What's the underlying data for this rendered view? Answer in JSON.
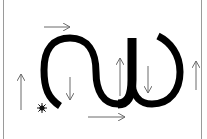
{
  "diagram": {
    "colors": {
      "background": "#ffffff",
      "curve": "#000000",
      "arrows": "#6b6b6b",
      "frame": "#9a9a9a",
      "star": "#111111"
    },
    "arrows": [
      {
        "id": "top-right-arrow",
        "direction": "right",
        "from": [
          44,
          27
        ],
        "to": [
          70,
          27
        ]
      },
      {
        "id": "left-up-arrow",
        "direction": "up",
        "from": [
          21,
          110
        ],
        "to": [
          21,
          74
        ]
      },
      {
        "id": "inner-down-arrow-left",
        "direction": "down",
        "from": [
          70,
          77
        ],
        "to": [
          70,
          100
        ]
      },
      {
        "id": "bottom-right-arrow",
        "direction": "right",
        "from": [
          88,
          117
        ],
        "to": [
          125,
          117
        ]
      },
      {
        "id": "inner-up-arrow",
        "direction": "up",
        "from": [
          120,
          96
        ],
        "to": [
          120,
          58
        ]
      },
      {
        "id": "inner-down-arrow-right",
        "direction": "down",
        "from": [
          148,
          66
        ],
        "to": [
          148,
          93
        ]
      },
      {
        "id": "right-up-arrow",
        "direction": "up",
        "from": [
          196,
          90
        ],
        "to": [
          196,
          61
        ]
      }
    ],
    "star": {
      "cx": 42,
      "cy": 108,
      "icon": "star-burst-icon"
    }
  }
}
